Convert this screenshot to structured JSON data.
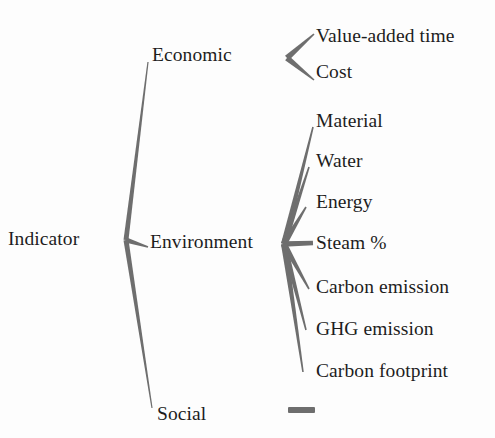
{
  "diagram": {
    "type": "tree",
    "background_color": "#fdfdfd",
    "line_color": "#6e6e6e",
    "text_color": "#1d1d1d",
    "root": {
      "label": "Indicator",
      "x": 8,
      "y": 229
    },
    "branches": [
      {
        "label": "Economic",
        "x": 152,
        "y": 45,
        "key": "economic"
      },
      {
        "label": "Environment",
        "x": 150,
        "y": 232,
        "key": "environment"
      },
      {
        "label": "Social",
        "x": 157,
        "y": 404,
        "key": "social"
      }
    ],
    "leaves": {
      "economic": [
        {
          "label": "Value-added time",
          "x": 316,
          "y": 26
        },
        {
          "label": "Cost",
          "x": 316,
          "y": 62
        }
      ],
      "environment": [
        {
          "label": "Material",
          "x": 316,
          "y": 111
        },
        {
          "label": "Water",
          "x": 316,
          "y": 151
        },
        {
          "label": "Energy",
          "x": 316,
          "y": 192
        },
        {
          "label": "Steam %",
          "x": 316,
          "y": 233
        },
        {
          "label": "Carbon emission",
          "x": 316,
          "y": 277
        },
        {
          "label": "GHG emission",
          "x": 316,
          "y": 319
        },
        {
          "label": "Carbon footprint",
          "x": 316,
          "y": 361
        }
      ],
      "social": []
    },
    "legend_dash": {
      "label": "",
      "x": 288,
      "y": 407,
      "width": 27,
      "height": 6
    },
    "edges": {
      "root_vertex": {
        "x": 126,
        "y": 240
      },
      "economic_tip": {
        "x": 148,
        "y": 62
      },
      "environment_tip": {
        "x": 148,
        "y": 247
      },
      "social_tip": {
        "x": 152,
        "y": 408
      },
      "economic_fork": {
        "x": 287,
        "y": 58
      },
      "economic_fork_up": {
        "x": 314,
        "y": 34
      },
      "economic_fork_down": {
        "x": 314,
        "y": 80
      },
      "environment_fan": {
        "x": 284,
        "y": 244
      },
      "fan_tips": [
        {
          "x": 313,
          "y": 127
        },
        {
          "x": 309,
          "y": 167
        },
        {
          "x": 306,
          "y": 207
        },
        {
          "x": 313,
          "y": 243
        },
        {
          "x": 309,
          "y": 289
        },
        {
          "x": 306,
          "y": 330
        },
        {
          "x": 303,
          "y": 372
        }
      ]
    }
  }
}
